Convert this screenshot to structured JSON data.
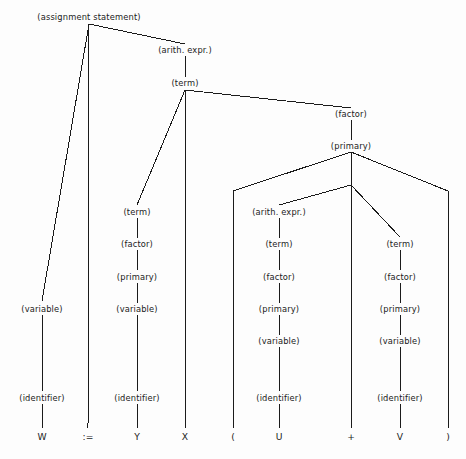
{
  "figure": {
    "name": "parse-tree",
    "background_color": "#fdfdfd",
    "line_color": "#1b1b1b",
    "width": 466,
    "height": 459
  },
  "chart_data": {
    "type": "diagram",
    "subtype": "parse-tree",
    "title": "",
    "expression": "W := Y X ( U + V )",
    "nonterminals": [
      {
        "id": "n0",
        "label": "(assignment statement)",
        "x": 89,
        "y": 17,
        "join_x": 89,
        "join_y": 24
      },
      {
        "id": "n1",
        "label": "(arith. expr.)",
        "x": 185,
        "y": 50,
        "join_x": 185,
        "join_y": 56
      },
      {
        "id": "n2",
        "label": "(term)",
        "x": 185,
        "y": 83,
        "join_x": 185,
        "join_y": 90
      },
      {
        "id": "n3",
        "label": "(factor)",
        "x": 351,
        "y": 114,
        "join_x": 351,
        "join_y": 120
      },
      {
        "id": "n4",
        "label": "(primary)",
        "x": 351,
        "y": 146,
        "join_x": 351,
        "join_y": 152
      },
      {
        "id": "n5",
        "label": "(term)",
        "x": 137,
        "y": 212,
        "join_x": 137,
        "join_y": 218
      },
      {
        "id": "n6",
        "label": "(factor)",
        "x": 137,
        "y": 244,
        "join_x": 137,
        "join_y": 250
      },
      {
        "id": "n7",
        "label": "(primary)",
        "x": 137,
        "y": 277,
        "join_x": 137,
        "join_y": 283
      },
      {
        "id": "n8",
        "label": "(variable)",
        "x": 137,
        "y": 309,
        "join_x": 137,
        "join_y": 315
      },
      {
        "id": "n9",
        "label": "(identifier)",
        "x": 137,
        "y": 398,
        "join_x": 137,
        "join_y": 404
      },
      {
        "id": "n10",
        "label": "(variable)",
        "x": 42,
        "y": 309,
        "join_x": 42,
        "join_y": 315
      },
      {
        "id": "n11",
        "label": "(identifier)",
        "x": 42,
        "y": 398,
        "join_x": 42,
        "join_y": 404
      },
      {
        "id": "n12",
        "label": "(arith. expr.)",
        "x": 279,
        "y": 212,
        "join_x": 279,
        "join_y": 218
      },
      {
        "id": "n13",
        "label": "(term)",
        "x": 279,
        "y": 244,
        "join_x": 279,
        "join_y": 250
      },
      {
        "id": "n14",
        "label": "(factor)",
        "x": 279,
        "y": 277,
        "join_x": 279,
        "join_y": 283
      },
      {
        "id": "n15",
        "label": "(primary)",
        "x": 279,
        "y": 309,
        "join_x": 279,
        "join_y": 315
      },
      {
        "id": "n16",
        "label": "(variable)",
        "x": 279,
        "y": 341,
        "join_x": 279,
        "join_y": 347
      },
      {
        "id": "n17",
        "label": "(identifier)",
        "x": 279,
        "y": 398,
        "join_x": 279,
        "join_y": 404
      },
      {
        "id": "n18",
        "label": "(term)",
        "x": 400,
        "y": 244,
        "join_x": 400,
        "join_y": 250
      },
      {
        "id": "n19",
        "label": "(factor)",
        "x": 400,
        "y": 277,
        "join_x": 400,
        "join_y": 283
      },
      {
        "id": "n20",
        "label": "(primary)",
        "x": 400,
        "y": 309,
        "join_x": 400,
        "join_y": 315
      },
      {
        "id": "n21",
        "label": "(variable)",
        "x": 400,
        "y": 341,
        "join_x": 400,
        "join_y": 347
      },
      {
        "id": "n22",
        "label": "(identifier)",
        "x": 400,
        "y": 398,
        "join_x": 400,
        "join_y": 404
      }
    ],
    "terminals": [
      {
        "id": "t0",
        "label": "W",
        "x": 42,
        "y": 437
      },
      {
        "id": "t1",
        "label": ":=",
        "x": 88,
        "y": 437
      },
      {
        "id": "t2",
        "label": "Y",
        "x": 137,
        "y": 437
      },
      {
        "id": "t3",
        "label": "X",
        "x": 185,
        "y": 437
      },
      {
        "id": "t4",
        "label": "(",
        "x": 233,
        "y": 437
      },
      {
        "id": "t5",
        "label": "U",
        "x": 279,
        "y": 437
      },
      {
        "id": "t6",
        "label": "+",
        "x": 351,
        "y": 437
      },
      {
        "id": "t7",
        "label": "V",
        "x": 400,
        "y": 437
      },
      {
        "id": "t8",
        "label": ")",
        "x": 448,
        "y": 437
      }
    ],
    "edges": [
      {
        "from": "n0",
        "to": "n10",
        "x1": 89,
        "y1": 24,
        "x2": 42,
        "y2": 301
      },
      {
        "from": "n0",
        "to": "t1",
        "x1": 89,
        "y1": 24,
        "x2": 88,
        "y2": 428
      },
      {
        "from": "n0",
        "to": "n1",
        "x1": 89,
        "y1": 24,
        "x2": 185,
        "y2": 44
      },
      {
        "from": "n1",
        "to": "n2",
        "x1": 185,
        "y1": 56,
        "x2": 185,
        "y2": 77
      },
      {
        "from": "n2",
        "to": "n5",
        "x1": 185,
        "y1": 90,
        "x2": 137,
        "y2": 205
      },
      {
        "from": "n2",
        "to": "t3",
        "x1": 185,
        "y1": 90,
        "x2": 185,
        "y2": 428
      },
      {
        "from": "n2",
        "to": "n3",
        "x1": 185,
        "y1": 90,
        "x2": 351,
        "y2": 108
      },
      {
        "from": "n3",
        "to": "n4",
        "x1": 351,
        "y1": 120,
        "x2": 351,
        "y2": 140
      },
      {
        "from": "n4",
        "to": "t4",
        "x1": 351,
        "y1": 152,
        "x2": 233,
        "y2": 191
      },
      {
        "from": "n4",
        "to": "n-in",
        "x1": 351,
        "y1": 152,
        "x2": 351,
        "y2": 185
      },
      {
        "from": "n4",
        "to": "t8",
        "x1": 351,
        "y1": 152,
        "x2": 448,
        "y2": 191
      },
      {
        "from": "t4",
        "to": "t4b",
        "x1": 233,
        "y1": 191,
        "x2": 233,
        "y2": 428
      },
      {
        "from": "t8",
        "to": "t8b",
        "x1": 448,
        "y1": 191,
        "x2": 448,
        "y2": 428
      },
      {
        "from": "n-in",
        "to": "n12",
        "x1": 351,
        "y1": 185,
        "x2": 279,
        "y2": 205
      },
      {
        "from": "n-in",
        "to": "t6",
        "x1": 351,
        "y1": 185,
        "x2": 351,
        "y2": 428
      },
      {
        "from": "n-in",
        "to": "n18",
        "x1": 351,
        "y1": 185,
        "x2": 400,
        "y2": 237
      },
      {
        "from": "n5",
        "to": "n6",
        "x1": 137,
        "y1": 218,
        "x2": 137,
        "y2": 238
      },
      {
        "from": "n6",
        "to": "n7",
        "x1": 137,
        "y1": 250,
        "x2": 137,
        "y2": 270
      },
      {
        "from": "n7",
        "to": "n8",
        "x1": 137,
        "y1": 283,
        "x2": 137,
        "y2": 303
      },
      {
        "from": "n8",
        "to": "n9",
        "x1": 137,
        "y1": 315,
        "x2": 137,
        "y2": 391
      },
      {
        "from": "n9",
        "to": "t2",
        "x1": 137,
        "y1": 404,
        "x2": 137,
        "y2": 428
      },
      {
        "from": "n10",
        "to": "n11",
        "x1": 42,
        "y1": 315,
        "x2": 42,
        "y2": 391
      },
      {
        "from": "n11",
        "to": "t0",
        "x1": 42,
        "y1": 404,
        "x2": 42,
        "y2": 428
      },
      {
        "from": "n12",
        "to": "n13",
        "x1": 279,
        "y1": 218,
        "x2": 279,
        "y2": 238
      },
      {
        "from": "n13",
        "to": "n14",
        "x1": 279,
        "y1": 250,
        "x2": 279,
        "y2": 270
      },
      {
        "from": "n14",
        "to": "n15",
        "x1": 279,
        "y1": 283,
        "x2": 279,
        "y2": 303
      },
      {
        "from": "n15",
        "to": "n16",
        "x1": 279,
        "y1": 315,
        "x2": 279,
        "y2": 335
      },
      {
        "from": "n16",
        "to": "n17",
        "x1": 279,
        "y1": 347,
        "x2": 279,
        "y2": 391
      },
      {
        "from": "n17",
        "to": "t5",
        "x1": 279,
        "y1": 404,
        "x2": 279,
        "y2": 428
      },
      {
        "from": "n18",
        "to": "n19",
        "x1": 400,
        "y1": 250,
        "x2": 400,
        "y2": 270
      },
      {
        "from": "n19",
        "to": "n20",
        "x1": 400,
        "y1": 283,
        "x2": 400,
        "y2": 303
      },
      {
        "from": "n20",
        "to": "n21",
        "x1": 400,
        "y1": 315,
        "x2": 400,
        "y2": 335
      },
      {
        "from": "n21",
        "to": "n22",
        "x1": 400,
        "y1": 347,
        "x2": 400,
        "y2": 391
      },
      {
        "from": "n22",
        "to": "t7",
        "x1": 400,
        "y1": 404,
        "x2": 400,
        "y2": 428
      }
    ]
  }
}
